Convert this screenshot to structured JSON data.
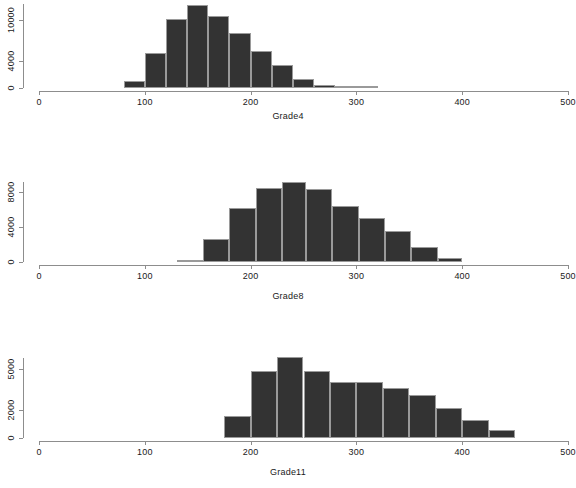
{
  "figure": {
    "background_color": "#ffffff",
    "bar_fill_color": "#333333",
    "bar_border_color": "#9a9a9a",
    "axis_color": "#8d8d8d",
    "text_color": "#1a1a1a"
  },
  "chart_data": [
    {
      "type": "bar",
      "title": "",
      "xlabel": "Grade4",
      "ylabel": "",
      "xlim": [
        0,
        500
      ],
      "ylim": [
        0,
        12400
      ],
      "grid": false,
      "legend": "none",
      "x_ticks": [
        0,
        100,
        200,
        300,
        400,
        500
      ],
      "x_tick_labels": [
        "0",
        "100",
        "200",
        "300",
        "400",
        "500"
      ],
      "y_ticks": [
        0,
        4000,
        10000
      ],
      "y_tick_labels": [
        "0",
        "4000",
        "10000"
      ],
      "bin_edges": [
        80,
        100,
        120,
        140,
        160,
        180,
        200,
        220,
        240,
        260,
        280,
        300,
        320
      ],
      "bin_width": 20,
      "values": [
        1000,
        1000,
        5100,
        10200,
        12300,
        10600,
        8100,
        5400,
        3400,
        1400,
        400,
        250
      ],
      "bars": [
        {
          "x0": 80,
          "x1": 100,
          "value": 1000
        },
        {
          "x0": 100,
          "x1": 120,
          "value": 5100
        },
        {
          "x0": 120,
          "x1": 140,
          "value": 10200
        },
        {
          "x0": 140,
          "x1": 160,
          "value": 12300
        },
        {
          "x0": 160,
          "x1": 180,
          "value": 10600
        },
        {
          "x0": 180,
          "x1": 200,
          "value": 8100
        },
        {
          "x0": 200,
          "x1": 220,
          "value": 5400
        },
        {
          "x0": 220,
          "x1": 240,
          "value": 3400
        },
        {
          "x0": 240,
          "x1": 260,
          "value": 1400
        },
        {
          "x0": 260,
          "x1": 280,
          "value": 400
        },
        {
          "x0": 280,
          "x1": 300,
          "value": 250
        },
        {
          "x0": 300,
          "x1": 320,
          "value": 250
        }
      ]
    },
    {
      "type": "bar",
      "title": "",
      "xlabel": "Grade8",
      "ylabel": "",
      "xlim": [
        0,
        500
      ],
      "ylim": [
        0,
        9600
      ],
      "grid": false,
      "legend": "none",
      "x_ticks": [
        0,
        100,
        200,
        300,
        400,
        500
      ],
      "x_tick_labels": [
        "0",
        "100",
        "200",
        "300",
        "400",
        "500"
      ],
      "y_ticks": [
        0,
        4000,
        8000
      ],
      "y_tick_labels": [
        "0",
        "4000",
        "8000"
      ],
      "bin_edges": [
        130,
        150,
        170,
        190,
        210,
        230,
        250,
        270,
        290,
        310,
        330,
        350,
        370,
        390,
        400
      ],
      "bin_width": 20,
      "values": [
        200,
        2600,
        6200,
        8500,
        9200,
        8400,
        6400,
        5000,
        3500,
        1700,
        500
      ],
      "bars": [
        {
          "x0": 130,
          "x1": 155,
          "value": 200
        },
        {
          "x0": 155,
          "x1": 180,
          "value": 2600
        },
        {
          "x0": 180,
          "x1": 205,
          "value": 6200
        },
        {
          "x0": 205,
          "x1": 230,
          "value": 8500
        },
        {
          "x0": 230,
          "x1": 252,
          "value": 9200
        },
        {
          "x0": 252,
          "x1": 277,
          "value": 8400
        },
        {
          "x0": 277,
          "x1": 302,
          "value": 6400
        },
        {
          "x0": 302,
          "x1": 327,
          "value": 5000
        },
        {
          "x0": 327,
          "x1": 352,
          "value": 3500
        },
        {
          "x0": 352,
          "x1": 377,
          "value": 1700
        },
        {
          "x0": 377,
          "x1": 400,
          "value": 500
        }
      ]
    },
    {
      "type": "bar",
      "title": "",
      "xlabel": "Grade11",
      "ylabel": "",
      "xlim": [
        0,
        500
      ],
      "ylim": [
        0,
        6100
      ],
      "grid": false,
      "legend": "none",
      "x_ticks": [
        0,
        100,
        200,
        300,
        400,
        500
      ],
      "x_tick_labels": [
        "0",
        "100",
        "200",
        "300",
        "400",
        "500"
      ],
      "y_ticks": [
        0,
        2000,
        5000
      ],
      "y_tick_labels": [
        "0",
        "2000",
        "5000"
      ],
      "bin_edges": [
        175,
        200,
        225,
        250,
        275,
        300,
        325,
        350,
        375,
        400,
        425,
        450
      ],
      "bin_width": 25,
      "values": [
        1600,
        4900,
        5900,
        4900,
        4100,
        4100,
        3600,
        3100,
        2200,
        1300,
        600
      ],
      "bars": [
        {
          "x0": 175,
          "x1": 200,
          "value": 1600
        },
        {
          "x0": 200,
          "x1": 225,
          "value": 4900
        },
        {
          "x0": 225,
          "x1": 250,
          "value": 5900
        },
        {
          "x0": 250,
          "x1": 275,
          "value": 4900
        },
        {
          "x0": 275,
          "x1": 300,
          "value": 4100
        },
        {
          "x0": 300,
          "x1": 325,
          "value": 4100
        },
        {
          "x0": 325,
          "x1": 350,
          "value": 3600
        },
        {
          "x0": 350,
          "x1": 375,
          "value": 3100
        },
        {
          "x0": 375,
          "x1": 400,
          "value": 2200
        },
        {
          "x0": 400,
          "x1": 425,
          "value": 1300
        },
        {
          "x0": 425,
          "x1": 450,
          "value": 600
        }
      ]
    }
  ],
  "layout": {
    "panels": [
      {
        "top": 0,
        "plot_left": 39,
        "plot_right": 568,
        "plot_top": 4,
        "plot_bottom": 88,
        "axis_y": 91,
        "tick_label_y": 97,
        "title_y": 111,
        "y_axis_x": 23,
        "y_axis_top": 4,
        "y_axis_bottom": 88
      },
      {
        "top": 176,
        "plot_left": 39,
        "plot_right": 568,
        "plot_top": 178,
        "plot_bottom": 262,
        "axis_y": 265,
        "tick_label_y": 271,
        "title_y": 291,
        "y_axis_x": 23,
        "y_axis_top": 182,
        "y_axis_bottom": 262
      },
      {
        "top": 352,
        "plot_left": 39,
        "plot_right": 568,
        "plot_top": 354,
        "plot_bottom": 438,
        "axis_y": 441,
        "tick_label_y": 447,
        "title_y": 467,
        "y_axis_x": 23,
        "y_axis_top": 358,
        "y_axis_bottom": 438
      }
    ]
  }
}
